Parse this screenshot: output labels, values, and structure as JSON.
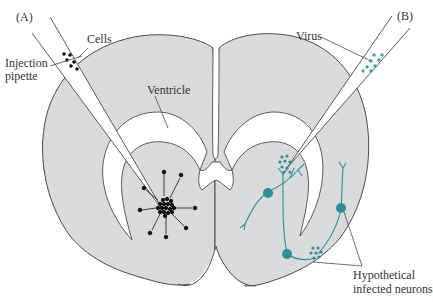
{
  "figure": {
    "panels": [
      {
        "id": "A",
        "label": "(A)"
      },
      {
        "id": "B",
        "label": "(B)"
      }
    ],
    "labels": {
      "cells": "Cells",
      "injection_pipette_line1": "Injection",
      "injection_pipette_line2": "pipette",
      "ventricle": "Ventricle",
      "virus": "Virus",
      "neurons_line1": "Hypothetical",
      "neurons_line2": "infected neurons"
    },
    "colors": {
      "tissue": "#d9dadb",
      "outline": "#4a4a4a",
      "cells": "#111111",
      "virus": "#3aa6a8",
      "neuron": "#2f8f98",
      "background": "#ffffff"
    }
  }
}
